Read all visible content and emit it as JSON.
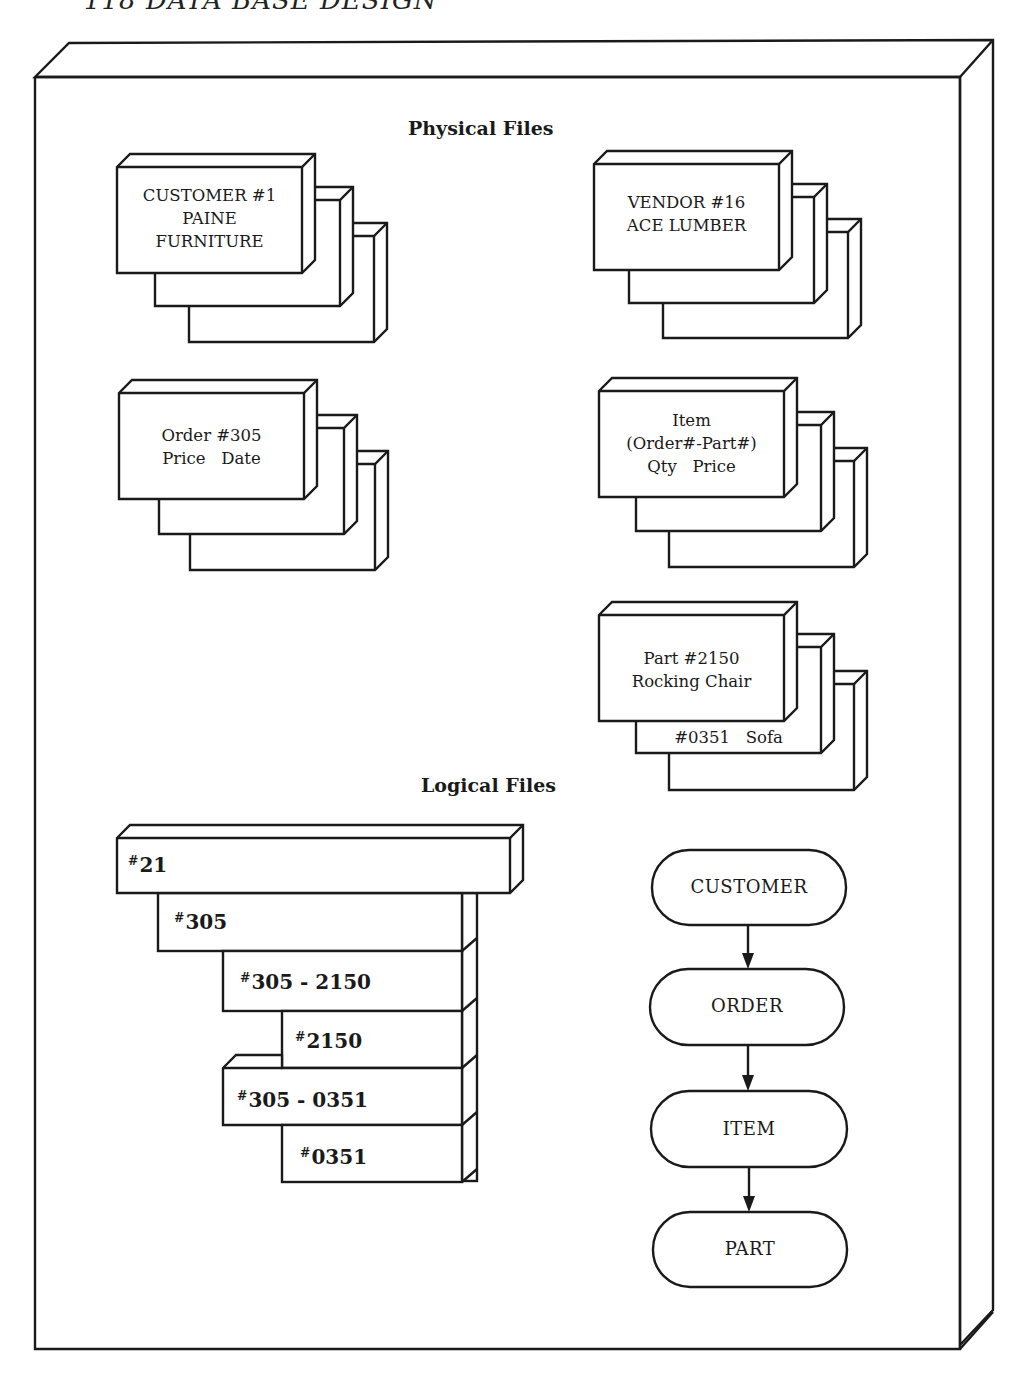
{
  "page_header": "118   DATA BASE DESIGN",
  "sections": {
    "physical_title": "Physical Files",
    "logical_title": "Logical Files"
  },
  "physical_files": [
    {
      "id": "customer",
      "lines": [
        "CUSTOMER #1",
        "PAINE",
        "FURNITURE"
      ]
    },
    {
      "id": "vendor",
      "lines": [
        "VENDOR #16",
        "ACE LUMBER"
      ]
    },
    {
      "id": "order",
      "lines": [
        "Order #305",
        "Price   Date"
      ]
    },
    {
      "id": "item",
      "lines": [
        "Item",
        "(Order#-Part#)",
        "Qty   Price"
      ]
    },
    {
      "id": "part",
      "lines": [
        "Part #2150",
        "Rocking Chair"
      ],
      "second_card": "#0351   Sofa"
    }
  ],
  "logical_files": [
    {
      "hash": "#",
      "value": "21"
    },
    {
      "hash": "#",
      "value": "305"
    },
    {
      "hash": "#",
      "value": "305 - 2150"
    },
    {
      "hash": "#",
      "value": "2150"
    },
    {
      "hash": "#",
      "value": "305 - 0351"
    },
    {
      "hash": "#",
      "value": "0351"
    }
  ],
  "hierarchy": {
    "nodes": [
      "CUSTOMER",
      "ORDER",
      "ITEM",
      "PART"
    ],
    "edges": [
      [
        "CUSTOMER",
        "ORDER"
      ],
      [
        "ORDER",
        "ITEM"
      ],
      [
        "ITEM",
        "PART"
      ]
    ]
  }
}
